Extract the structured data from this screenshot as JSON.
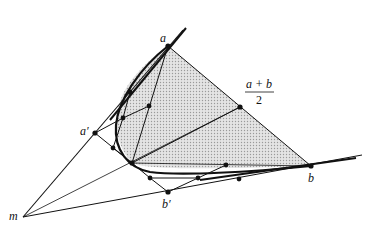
{
  "figure": {
    "labels": {
      "a": "a",
      "a_prime": "a′",
      "b": "b",
      "b_prime": "b′",
      "m": "m",
      "midpoint_num": "a + b",
      "midpoint_den": "2"
    },
    "colors": {
      "stroke": "#111111",
      "fill_shade": "#d6d6d6",
      "background": "#ffffff"
    }
  }
}
